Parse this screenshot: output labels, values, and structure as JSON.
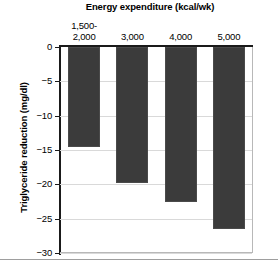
{
  "chart_data": {
    "type": "bar",
    "title": "Energy expenditure (kcal/wk)",
    "xlabel": "Energy expenditure (kcal/wk)",
    "ylabel": "Triglyceride reduction (mg/dl)",
    "categories": [
      "1,500-\n2,000",
      "3,000",
      "4,000",
      "5,000"
    ],
    "category_lines": [
      [
        "1,500-",
        "2,000"
      ],
      [
        "3,000"
      ],
      [
        "4,000"
      ],
      [
        "5,000"
      ]
    ],
    "values": [
      -14.5,
      -19.8,
      -22.5,
      -26.5
    ],
    "ylim": [
      -30,
      0
    ],
    "ytick_labels": [
      "0",
      "−5",
      "−10",
      "−15",
      "−20",
      "−25",
      "−30"
    ],
    "ytick_values": [
      0,
      -5,
      -10,
      -15,
      -20,
      -25,
      -30
    ],
    "grid": true,
    "legend": false,
    "bar_color": "#3b3b3b",
    "gridline_color": "#d9d9d9",
    "axis_color": "#1a1a1a"
  }
}
